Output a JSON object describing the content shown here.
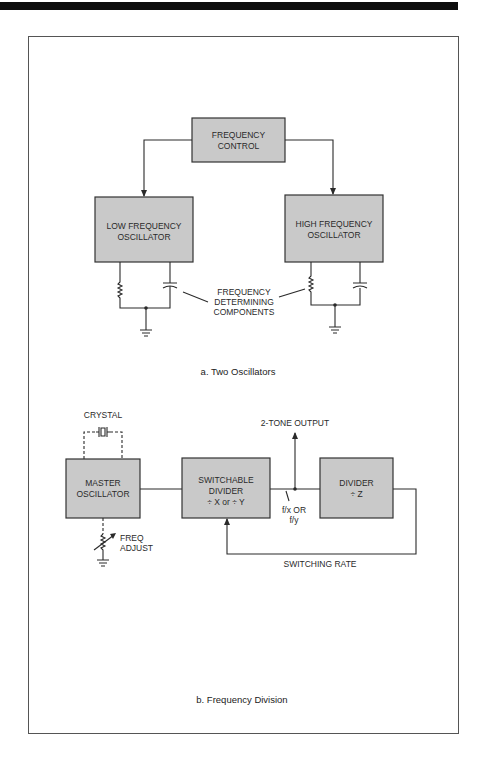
{
  "diagram_a": {
    "caption": "a. Two Oscillators",
    "frequency_control": {
      "line1": "FREQUENCY",
      "line2": "CONTROL"
    },
    "low_osc": {
      "line1": "LOW FREQUENCY",
      "line2": "OSCILLATOR"
    },
    "high_osc": {
      "line1": "HIGH FREQUENCY",
      "line2": "OSCILLATOR"
    },
    "components_label": {
      "line1": "FREQUENCY",
      "line2": "DETERMINING",
      "line3": "COMPONENTS"
    }
  },
  "diagram_b": {
    "caption": "b. Frequency Division",
    "crystal_label": "CRYSTAL",
    "master_osc": {
      "line1": "MASTER",
      "line2": "OSCILLATOR"
    },
    "switchable_divider": {
      "line1": "SWITCHABLE",
      "line2": "DIVIDER",
      "line3": "÷ X or ÷ Y"
    },
    "divider_z": {
      "line1": "DIVIDER",
      "line2": "÷ Z"
    },
    "output_label": "2-TONE OUTPUT",
    "freq_adjust": {
      "line1": "FREQ",
      "line2": "ADJUST"
    },
    "fx_label": {
      "line1": "f/x OR",
      "line2": "f/y"
    },
    "switching_rate_label": "SWITCHING RATE"
  },
  "colors": {
    "box_fill": "#c9c9c9",
    "line": "#2a2a2a",
    "top_bar": "#0d0d0d"
  }
}
